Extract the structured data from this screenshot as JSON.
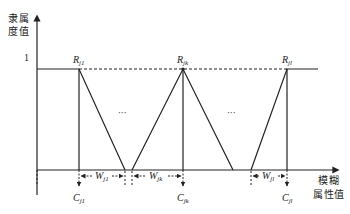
{
  "diagram": {
    "y_axis_label_line1": "隶属",
    "y_axis_label_line2": "度值",
    "x_axis_label_line1": "模糊",
    "x_axis_label_line2": "属性值",
    "y_tick_one": "1",
    "ellipsis_left": "···",
    "ellipsis_right": "···",
    "peaks": [
      {
        "name": "R",
        "sub": "j1"
      },
      {
        "name": "R",
        "sub": "jk"
      },
      {
        "name": "R",
        "sub": "jl"
      }
    ],
    "centers": [
      {
        "name": "C",
        "sub": "j1"
      },
      {
        "name": "C",
        "sub": "jk"
      },
      {
        "name": "C",
        "sub": "jl"
      }
    ],
    "widths": [
      {
        "name": "W",
        "sub": "j1"
      },
      {
        "name": "W",
        "sub": "jk"
      },
      {
        "name": "W",
        "sub": "jl"
      }
    ],
    "colors": {
      "line": "#222222",
      "background": "#ffffff"
    }
  }
}
